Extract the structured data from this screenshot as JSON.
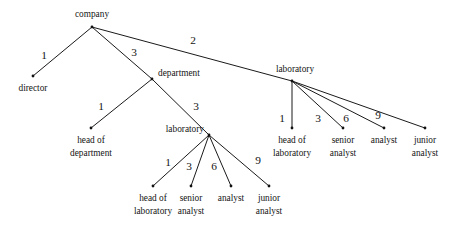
{
  "diagram": {
    "type": "tree",
    "title": "",
    "background_color": "#ffffff",
    "line_color": "#1a1a1a",
    "text_color": "#141414",
    "nodes": [
      {
        "id": "company",
        "label": "company",
        "label_line2": "",
        "x": 92,
        "y": 27,
        "label_x": 92,
        "label_y": 17,
        "label_anchor": "middle"
      },
      {
        "id": "director",
        "label": "director",
        "label_line2": "",
        "x": 33,
        "y": 76,
        "label_x": 33,
        "label_y": 91,
        "label_anchor": "middle"
      },
      {
        "id": "department",
        "label": "department",
        "label_line2": "",
        "x": 152,
        "y": 79,
        "label_x": 158,
        "label_y": 76,
        "label_anchor": "start"
      },
      {
        "id": "laboratory-right",
        "label": "laboratory",
        "label_line2": "",
        "x": 292,
        "y": 81,
        "label_x": 295,
        "label_y": 72,
        "label_anchor": "middle"
      },
      {
        "id": "head-of-department",
        "label": "head of",
        "label_line2": "department",
        "x": 91,
        "y": 128,
        "label_x": 91,
        "label_y": 143,
        "label_anchor": "middle"
      },
      {
        "id": "laboratory-left",
        "label": "laboratory",
        "label_line2": "",
        "x": 209,
        "y": 135,
        "label_x": 204,
        "label_y": 132,
        "label_anchor": "end"
      },
      {
        "id": "head-of-laboratory-left",
        "label": "head of",
        "label_line2": "laboratory",
        "x": 153,
        "y": 186,
        "label_x": 153,
        "label_y": 201,
        "label_anchor": "middle"
      },
      {
        "id": "senior-analyst-left",
        "label": "senior",
        "label_line2": "analyst",
        "x": 191,
        "y": 186,
        "label_x": 191,
        "label_y": 201,
        "label_anchor": "middle"
      },
      {
        "id": "analyst-left",
        "label": "analyst",
        "label_line2": "",
        "x": 231,
        "y": 186,
        "label_x": 231,
        "label_y": 201,
        "label_anchor": "middle"
      },
      {
        "id": "junior-analyst-left",
        "label": "junior",
        "label_line2": "analyst",
        "x": 269,
        "y": 186,
        "label_x": 269,
        "label_y": 201,
        "label_anchor": "middle"
      },
      {
        "id": "head-of-laboratory-right",
        "label": "head of",
        "label_line2": "laboratory",
        "x": 292,
        "y": 128,
        "label_x": 292,
        "label_y": 143,
        "label_anchor": "middle"
      },
      {
        "id": "senior-analyst-right",
        "label": "senior",
        "label_line2": "analyst",
        "x": 343,
        "y": 128,
        "label_x": 343,
        "label_y": 143,
        "label_anchor": "middle"
      },
      {
        "id": "analyst-right",
        "label": "analyst",
        "label_line2": "",
        "x": 384,
        "y": 128,
        "label_x": 384,
        "label_y": 143,
        "label_anchor": "middle"
      },
      {
        "id": "junior-analyst-right",
        "label": "junior",
        "label_line2": "analyst",
        "x": 425,
        "y": 128,
        "label_x": 425,
        "label_y": 143,
        "label_anchor": "middle"
      }
    ],
    "edges": [
      {
        "id": "company-director",
        "from": "company",
        "to": "director",
        "label": "1",
        "label_x": 44,
        "label_y": 59
      },
      {
        "id": "company-department",
        "from": "company",
        "to": "department",
        "label": "3",
        "label_x": 134,
        "label_y": 56
      },
      {
        "id": "company-laboratory",
        "from": "company",
        "to": "laboratory-right",
        "label": "2",
        "label_x": 193,
        "label_y": 44
      },
      {
        "id": "department-head-of-department",
        "from": "department",
        "to": "head-of-department",
        "label": "1",
        "label_x": 101,
        "label_y": 110
      },
      {
        "id": "department-laboratory",
        "from": "department",
        "to": "laboratory-left",
        "label": "3",
        "label_x": 196,
        "label_y": 110
      },
      {
        "id": "laboratory-left-head-of-laboratory",
        "from": "laboratory-left",
        "to": "head-of-laboratory-left",
        "label": "1",
        "label_x": 168,
        "label_y": 166
      },
      {
        "id": "laboratory-left-senior-analyst",
        "from": "laboratory-left",
        "to": "senior-analyst-left",
        "label": "3",
        "label_x": 189,
        "label_y": 170
      },
      {
        "id": "laboratory-left-analyst",
        "from": "laboratory-left",
        "to": "analyst-left",
        "label": "6",
        "label_x": 214,
        "label_y": 170
      },
      {
        "id": "laboratory-left-junior-analyst",
        "from": "laboratory-left",
        "to": "junior-analyst-left",
        "label": "9",
        "label_x": 258,
        "label_y": 164
      },
      {
        "id": "laboratory-right-head-of-laboratory",
        "from": "laboratory-right",
        "to": "head-of-laboratory-right",
        "label": "1",
        "label_x": 282,
        "label_y": 122
      },
      {
        "id": "laboratory-right-senior-analyst",
        "from": "laboratory-right",
        "to": "senior-analyst-right",
        "label": "3",
        "label_x": 318,
        "label_y": 122
      },
      {
        "id": "laboratory-right-analyst",
        "from": "laboratory-right",
        "to": "analyst-right",
        "label": "6",
        "label_x": 346,
        "label_y": 122
      },
      {
        "id": "laboratory-right-junior-analyst",
        "from": "laboratory-right",
        "to": "junior-analyst-right",
        "label": "9",
        "label_x": 378,
        "label_y": 119
      }
    ]
  }
}
